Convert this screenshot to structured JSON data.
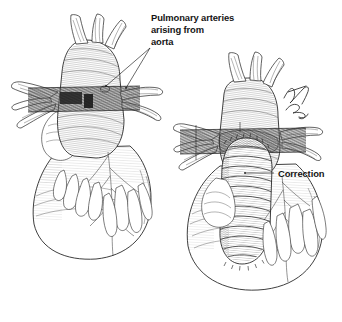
{
  "figure": {
    "background_color": "#ffffff",
    "ink_color": "#1c1c1c",
    "style": "pen-and-ink medical line engraving",
    "panel_count": 2
  },
  "labels": {
    "left": {
      "name": "pulmonary-arteries-label",
      "line1": "Pulmonary arteries",
      "line2": "arising from",
      "line3": "aorta",
      "x": 151,
      "y": 18,
      "leader_count": 2
    },
    "right": {
      "name": "correction-label",
      "text": "Correction",
      "x": 278,
      "y": 176,
      "leader_count": 1
    }
  },
  "panels": [
    {
      "id": "left-heart",
      "name": "heart-defect-illustration",
      "caption_ref": "Pulmonary arteries arising from aorta",
      "bounds": {
        "x": 8,
        "y": 14,
        "width": 152,
        "height": 248
      },
      "features": [
        "aortic-trunk",
        "arch-branches",
        "pulmonary-artery-band",
        "right-atrium",
        "left-ventricle",
        "coronary-arteries",
        "epicardial-fat"
      ],
      "arch_branch_count": 3,
      "band_color": "#6d6d6d"
    },
    {
      "id": "right-heart",
      "name": "heart-correction-illustration",
      "caption_ref": "Correction",
      "bounds": {
        "x": 172,
        "y": 52,
        "width": 168,
        "height": 262
      },
      "features": [
        "aortic-trunk",
        "arch-branches",
        "pulmonary-artery-band",
        "sutured-conduit-graft",
        "suture-line",
        "left-ventricle",
        "coronary-arteries",
        "epicardial-fat",
        "artist-signature"
      ],
      "arch_branch_count": 3,
      "band_color": "#6d6d6d",
      "conduit_rib_count": 14
    }
  ],
  "signature": {
    "name": "artist-signature",
    "legible": false,
    "x": 288,
    "y": 98
  }
}
